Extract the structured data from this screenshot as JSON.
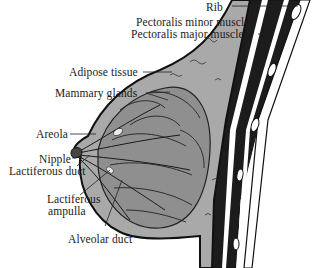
{
  "diagram": {
    "colors": {
      "tissue_fill": "#a9a9a9",
      "gland_fill": "#8f8f8f",
      "muscle_fill": "#1c1c1c",
      "outline": "#111111",
      "background": "#ffffff",
      "leader_line": "#222222"
    },
    "labels": [
      {
        "id": "rib",
        "text": "Rib"
      },
      {
        "id": "pectoralis_minor",
        "text": "Pectoralis minor muscle"
      },
      {
        "id": "pectoralis_major",
        "text": "Pectoralis major muscle"
      },
      {
        "id": "adipose",
        "text": "Adipose tissue"
      },
      {
        "id": "mammary_glands",
        "text": "Mammary glands"
      },
      {
        "id": "areola",
        "text": "Areola"
      },
      {
        "id": "nipple",
        "text": "Nipple"
      },
      {
        "id": "lactiferous_duct",
        "text": "Lactiferous duct"
      },
      {
        "id": "lactiferous_ampulla_1",
        "text": "Lactiferous"
      },
      {
        "id": "lactiferous_ampulla_2",
        "text": "ampulla"
      },
      {
        "id": "alveolar_duct",
        "text": "Alveolar duct"
      }
    ]
  }
}
